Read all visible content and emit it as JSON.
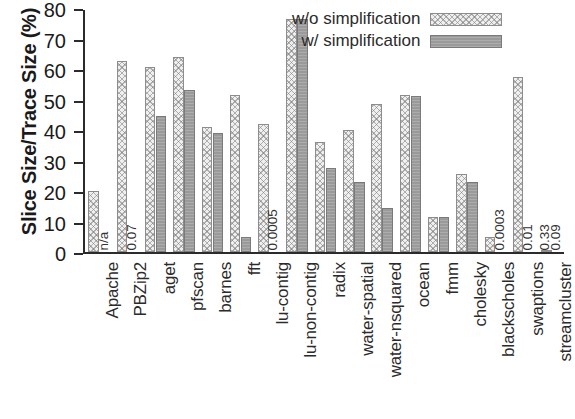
{
  "chart_data": {
    "type": "bar",
    "title": "",
    "xlabel": "",
    "ylabel": "Slice Size/Trace Size (%)",
    "ylim": [
      0,
      80
    ],
    "ytick_step": 10,
    "yticks": [
      0,
      10,
      20,
      30,
      40,
      50,
      60,
      70,
      80
    ],
    "grid": false,
    "legend_position": "top-right",
    "categories": [
      "Apache",
      "PBZip2",
      "aget",
      "pfscan",
      "barnes",
      "fft",
      "lu-contig",
      "lu-non-contig",
      "radix",
      "water-spatial",
      "water-nsquared",
      "ocean",
      "fmm",
      "cholesky",
      "blackscholes",
      "swaptions",
      "streamcluster"
    ],
    "series": [
      {
        "name": "w/o simplification",
        "style": "light-hatched",
        "values": [
          20,
          62.5,
          60.5,
          64,
          41,
          51.5,
          42,
          76.5,
          36,
          40,
          48.5,
          51.5,
          11.5,
          25.5,
          5,
          57.5,
          0.33
        ]
      },
      {
        "name": "w/ simplification",
        "style": "solid-gray",
        "values": [
          null,
          null,
          44.5,
          53,
          39,
          5,
          0.0005,
          76.5,
          27.5,
          23,
          14.5,
          51,
          11.5,
          23,
          0.0003,
          0.01,
          0.09
        ]
      }
    ],
    "annotations": [
      {
        "category": "Apache",
        "series": "w/ simplification",
        "text": "n/a"
      },
      {
        "category": "PBZip2",
        "series": "w/ simplification",
        "text": "0.07"
      },
      {
        "category": "lu-contig",
        "series": "w/ simplification",
        "text": "0.0005"
      },
      {
        "category": "blackscholes",
        "series": "w/ simplification",
        "text": "0.0003"
      },
      {
        "category": "swaptions",
        "series": "w/ simplification",
        "text": "0.01"
      },
      {
        "category": "streamcluster",
        "series": "w/o simplification",
        "text": "0.33"
      },
      {
        "category": "streamcluster",
        "series": "w/ simplification",
        "text": "0.09"
      }
    ],
    "colors": {
      "light_fill": "#efefef",
      "light_edge": "#8d8d8d",
      "dark_fill": "#9a9a9a",
      "dark_edge": "#7a7a7a",
      "axis": "#2b2b2b",
      "text": "#1a1a1a",
      "background": "#ffffff"
    }
  },
  "legend": {
    "entries": [
      {
        "label": "w/o simplification",
        "swatch": "light-hatched"
      },
      {
        "label": "w/ simplification",
        "swatch": "solid-gray"
      }
    ]
  }
}
